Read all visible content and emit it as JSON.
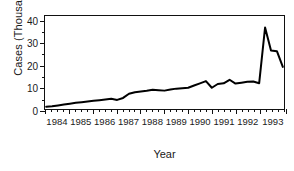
{
  "chart_data": {
    "type": "line",
    "title": "",
    "xlabel": "Year",
    "ylabel": "Cases (Thousands)",
    "xlim": [
      1983.75,
      1993.85
    ],
    "ylim": [
      0,
      42
    ],
    "grid": false,
    "legend": null,
    "y_ticks": [
      0,
      10,
      20,
      30,
      40
    ],
    "y_tick_labels": [
      "0",
      "10",
      "20",
      "30",
      "40"
    ],
    "y_minor_ticks": [
      5,
      15,
      25,
      35
    ],
    "x_tick_labels": [
      "1984",
      "1985",
      "1986",
      "1987",
      "1988",
      "1989",
      "1990",
      "1991",
      "1992",
      "1993"
    ],
    "x_year_boundaries": [
      1983.75,
      1984.75,
      1985.75,
      1986.75,
      1987.75,
      1988.75,
      1989.75,
      1990.75,
      1991.75,
      1992.75,
      1993.85
    ],
    "x_minor_tick_interval": 0.25,
    "line_color": "#000000",
    "line_width": 2,
    "series": [
      {
        "name": "Cases",
        "x": [
          1983.8,
          1984.05,
          1984.3,
          1984.55,
          1984.8,
          1985.05,
          1985.3,
          1985.55,
          1985.8,
          1986.05,
          1986.3,
          1986.55,
          1986.8,
          1987.05,
          1987.3,
          1987.55,
          1987.8,
          1988.05,
          1988.3,
          1988.55,
          1988.8,
          1989.05,
          1989.3,
          1989.55,
          1989.8,
          1990.05,
          1990.3,
          1990.55,
          1990.8,
          1991.05,
          1991.3,
          1991.55,
          1991.8,
          1992.05,
          1992.3,
          1992.55,
          1992.8,
          1993.05,
          1993.3,
          1993.55,
          1993.8
        ],
        "y": [
          1.0,
          1.2,
          1.6,
          2.0,
          2.4,
          2.8,
          3.1,
          3.4,
          3.7,
          4.0,
          4.3,
          4.6,
          4.1,
          5.0,
          6.9,
          7.6,
          7.9,
          8.2,
          8.7,
          8.5,
          8.3,
          8.8,
          9.2,
          9.4,
          9.6,
          10.6,
          11.6,
          12.6,
          9.6,
          11.3,
          11.6,
          13.2,
          11.5,
          11.9,
          12.3,
          12.4,
          11.6,
          36.8,
          26.4,
          26.1,
          19.0
        ]
      }
    ]
  }
}
